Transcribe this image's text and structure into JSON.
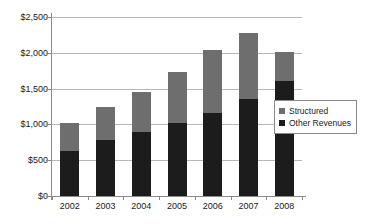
{
  "chart_data": {
    "type": "bar",
    "stacked": true,
    "title": "",
    "xlabel": "",
    "ylabel": "",
    "categories": [
      "2002",
      "2003",
      "2004",
      "2005",
      "2006",
      "2007",
      "2008"
    ],
    "series": [
      {
        "name": "Other Revenues",
        "color": "#1c1c1c",
        "values": [
          630,
          780,
          900,
          1020,
          1155,
          1355,
          1610
        ]
      },
      {
        "name": "Structured",
        "color": "#6e6e6e",
        "values": [
          395,
          465,
          550,
          710,
          885,
          915,
          400
        ]
      }
    ],
    "stack_order": [
      "Other Revenues",
      "Structured"
    ],
    "totals": [
      1025,
      1245,
      1450,
      1730,
      2040,
      2270,
      2010
    ],
    "ylim": [
      0,
      2500
    ],
    "ytick_values": [
      0,
      500,
      1000,
      1500,
      2000,
      2500
    ],
    "ytick_labels": [
      "$0",
      "$500",
      "$1,000",
      "$1,500",
      "$2,000",
      "$2,500"
    ],
    "grid": true,
    "legend_position": "right",
    "legend": [
      {
        "label": "Structured",
        "color": "#6e6e6e"
      },
      {
        "label": "Other Revenues",
        "color": "#1c1c1c"
      }
    ]
  }
}
